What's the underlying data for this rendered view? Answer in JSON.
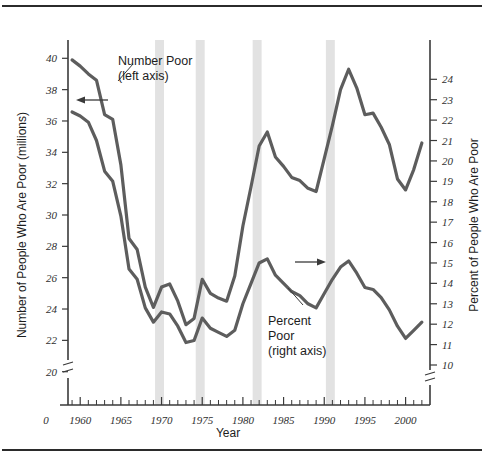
{
  "figure": {
    "background": "#ffffff",
    "series_color": "#5d5d5d",
    "band_color": "#e2e2e2",
    "axis_color": "#3a3a3a"
  },
  "labels": {
    "y_left_title": "Number of People Who Are Poor (millions)",
    "y_right_title": "Percent of People Who Are Poor",
    "x_title": "Year",
    "origin": "0",
    "annot_number_poor_line1": "Number Poor",
    "annot_number_poor_line2": "(left axis)",
    "annot_percent_poor_line1": "Percent",
    "annot_percent_poor_line2": "Poor",
    "annot_percent_poor_line3": "(right axis)"
  },
  "chart_data": {
    "type": "line",
    "title": "",
    "xlabel": "Year",
    "ylabel": "Number of People Who Are Poor (millions)",
    "y2label": "Percent of People Who Are Poor",
    "grid": false,
    "legend": "annotations",
    "xlim": [
      1958.5,
      2003
    ],
    "ylim": [
      19.3,
      40.6
    ],
    "y2lim": [
      9.4,
      24.9
    ],
    "x_ticks": [
      1960,
      1965,
      1970,
      1975,
      1980,
      1985,
      1990,
      1995,
      2000
    ],
    "x_minor_tick_step": 1,
    "y_left_ticks": [
      20,
      22,
      24,
      26,
      28,
      30,
      32,
      34,
      36,
      38,
      40
    ],
    "y_right_ticks": [
      10,
      11,
      12,
      13,
      14,
      15,
      16,
      17,
      18,
      19,
      20,
      21,
      22,
      23,
      24
    ],
    "axis_break_left": true,
    "axis_break_right": true,
    "recession_bands": [
      {
        "start": 1969.2,
        "end": 1970.3
      },
      {
        "start": 1974.2,
        "end": 1975.3
      },
      {
        "start": 1981.2,
        "end": 1982.3
      },
      {
        "start": 1990.2,
        "end": 1991.3
      }
    ],
    "x": [
      1959,
      1960,
      1961,
      1962,
      1963,
      1964,
      1965,
      1966,
      1967,
      1968,
      1969,
      1970,
      1971,
      1972,
      1973,
      1974,
      1975,
      1976,
      1977,
      1978,
      1979,
      1980,
      1981,
      1982,
      1983,
      1984,
      1985,
      1986,
      1987,
      1988,
      1989,
      1990,
      1991,
      1992,
      1993,
      1994,
      1995,
      1996,
      1997,
      1998,
      1999,
      2000,
      2001,
      2002
    ],
    "series": [
      {
        "name": "Number Poor (left axis)",
        "axis": "left",
        "units": "millions",
        "values": [
          39.9,
          39.5,
          39.0,
          38.6,
          36.4,
          36.1,
          33.2,
          28.5,
          27.8,
          25.4,
          24.1,
          25.4,
          25.6,
          24.5,
          23.0,
          23.4,
          25.9,
          25.0,
          24.7,
          24.5,
          26.1,
          29.3,
          31.8,
          34.4,
          35.3,
          33.7,
          33.1,
          32.4,
          32.2,
          31.7,
          31.5,
          33.6,
          35.7,
          38.0,
          39.3,
          38.1,
          36.4,
          36.5,
          35.6,
          34.5,
          32.3,
          31.6,
          32.9,
          34.6
        ]
      },
      {
        "name": "Percent Poor (right axis)",
        "axis": "right",
        "units": "percent",
        "values": [
          22.4,
          22.2,
          21.9,
          21.0,
          19.5,
          19.0,
          17.3,
          14.7,
          14.2,
          12.8,
          12.1,
          12.6,
          12.5,
          11.9,
          11.1,
          11.2,
          12.3,
          11.8,
          11.6,
          11.4,
          11.7,
          13.0,
          14.0,
          15.0,
          15.2,
          14.4,
          14.0,
          13.6,
          13.4,
          13.0,
          12.8,
          13.5,
          14.2,
          14.8,
          15.1,
          14.5,
          13.8,
          13.7,
          13.3,
          12.7,
          11.9,
          11.3,
          11.7,
          12.1
        ]
      }
    ],
    "annotations": [
      {
        "text": "Number Poor (left axis)",
        "points_to_series": "Number Poor (left axis)"
      },
      {
        "text": "Percent Poor (right axis)",
        "points_to_series": "Percent Poor (right axis)"
      },
      {
        "text": "left-pointing arrow to left axis"
      },
      {
        "text": "right-pointing arrow to right axis"
      }
    ]
  }
}
